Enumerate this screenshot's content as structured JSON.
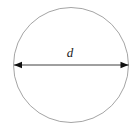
{
  "figure": {
    "kind": "geometry-diagram",
    "canvas": {
      "width": 139,
      "height": 129,
      "background_color": "#ffffff"
    },
    "circle": {
      "name": "circle-outline",
      "center_x": 71,
      "center_y": 65,
      "radius": 57.5,
      "stroke_color": "#9a9a9a",
      "stroke_width": 0.9,
      "fill": "none"
    },
    "diameter_arrow": {
      "name": "diameter-arrow",
      "x_start": 14,
      "x_end": 128.5,
      "y": 65,
      "stroke_color": "#2b2b2b",
      "stroke_width": 0.9,
      "arrowhead_length": 8,
      "arrowhead_half_width": 3.2,
      "arrowhead_color": "#111111",
      "double_headed": true
    },
    "labels": [
      {
        "name": "diameter-label",
        "text": "d",
        "x": 70,
        "y": 57,
        "style": "italic",
        "font_size": 13,
        "color": "#1a1a1a"
      }
    ]
  }
}
